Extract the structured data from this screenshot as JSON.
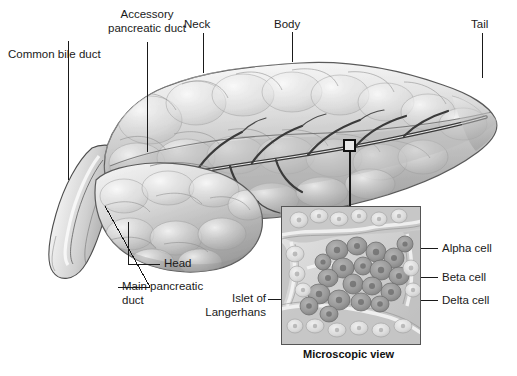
{
  "figure": {
    "domain": "anatomical-illustration",
    "background_color": "#ffffff",
    "ink_color": "#1a1a1a"
  },
  "labels": {
    "common_bile_duct": "Common bile duct",
    "accessory_pancreatic_duct_line1": "Accessory",
    "accessory_pancreatic_duct_line2": "pancreatic duct",
    "neck": "Neck",
    "body": "Body",
    "tail": "Tail",
    "head": "Head",
    "main_pancreatic_duct_line1": "Main pancreatic",
    "main_pancreatic_duct_line2": "duct",
    "islet_line1": "Islet of",
    "islet_line2": "Langerhans",
    "alpha_cell": "Alpha cell",
    "beta_cell": "Beta cell",
    "delta_cell": "Delta cell"
  },
  "inset": {
    "caption": "Microscopic view",
    "border_color": "#555555",
    "tissue_base_color": "#d2d2d2",
    "cell_dark_color": "#9a9a9a",
    "cell_light_color": "#e3e3e3"
  },
  "callout": {
    "marker_shape": "square",
    "marker_label": "sample-site-marker"
  },
  "organ": {
    "regions": [
      "Head",
      "Neck",
      "Body",
      "Tail"
    ],
    "ducts": [
      "Common bile duct",
      "Accessory pancreatic duct",
      "Main pancreatic duct"
    ],
    "tint_light": "#f2f2f2",
    "tint_mid": "#c9c9c9",
    "tint_dark": "#8f8f8f"
  }
}
